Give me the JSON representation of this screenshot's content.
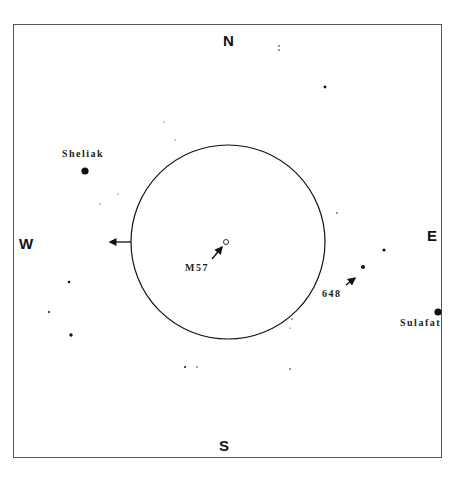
{
  "chart": {
    "title": "",
    "frame": {
      "x": 13,
      "y": 24,
      "w": 429,
      "h": 434
    },
    "directions": {
      "north": {
        "text": "N",
        "x": 223,
        "y": 33
      },
      "south": {
        "text": "S",
        "x": 219,
        "y": 438
      },
      "west": {
        "text": "W",
        "x": 19,
        "y": 236
      },
      "east": {
        "text": "E",
        "x": 427,
        "y": 228
      }
    },
    "field_circle": {
      "cx": 228,
      "cy": 242,
      "r": 97
    },
    "motion_arrow": {
      "x1": 131,
      "y1": 242,
      "x2": 110,
      "y2": 242,
      "direction": "west"
    },
    "labels": [
      {
        "id": "sheliak",
        "text": "Sheliak",
        "x": 62,
        "y": 149
      },
      {
        "id": "m57",
        "text": "M57",
        "x": 185,
        "y": 263
      },
      {
        "id": "sao-648",
        "text": "648",
        "x": 322,
        "y": 289
      },
      {
        "id": "sulafat",
        "text": "Sulafat",
        "x": 400,
        "y": 318
      }
    ],
    "targets": [
      {
        "id": "m57",
        "cx": 226,
        "cy": 242,
        "r": 2.5,
        "style": "ring"
      }
    ],
    "pointer_arrows": [
      {
        "id": "m57-pointer",
        "x1": 212,
        "y1": 259,
        "x2": 222,
        "y2": 247
      },
      {
        "id": "648-pointer",
        "x1": 346,
        "y1": 285,
        "x2": 355,
        "y2": 278
      }
    ],
    "stars": [
      {
        "name": "Sheliak",
        "cx": 85,
        "cy": 171,
        "r": 3.6
      },
      {
        "name": "Sulafat",
        "cx": 438,
        "cy": 312,
        "r": 3.6
      },
      {
        "name": "648",
        "cx": 363,
        "cy": 267,
        "r": 2
      },
      {
        "name": "",
        "cx": 384,
        "cy": 250,
        "r": 1.6
      },
      {
        "name": "",
        "cx": 325,
        "cy": 87,
        "r": 1.4
      },
      {
        "name": "",
        "cx": 279,
        "cy": 46,
        "r": 0.8
      },
      {
        "name": "",
        "cx": 279,
        "cy": 50,
        "r": 0.8
      },
      {
        "name": "",
        "cx": 69,
        "cy": 282,
        "r": 1.3
      },
      {
        "name": "",
        "cx": 49,
        "cy": 312,
        "r": 1
      },
      {
        "name": "",
        "cx": 71,
        "cy": 335,
        "r": 1.7
      },
      {
        "name": "",
        "cx": 185,
        "cy": 367,
        "r": 1
      },
      {
        "name": "",
        "cx": 197,
        "cy": 367,
        "r": 0.7
      },
      {
        "name": "",
        "cx": 290,
        "cy": 369,
        "r": 0.8
      },
      {
        "name": "",
        "cx": 337,
        "cy": 213,
        "r": 0.8
      },
      {
        "name": "",
        "cx": 164,
        "cy": 122,
        "r": 0.6
      },
      {
        "name": "",
        "cx": 175,
        "cy": 140,
        "r": 0.6
      },
      {
        "name": "",
        "cx": 100,
        "cy": 204,
        "r": 0.6
      },
      {
        "name": "",
        "cx": 118,
        "cy": 194,
        "r": 0.6
      },
      {
        "name": "",
        "cx": 292,
        "cy": 319,
        "r": 0.7
      },
      {
        "name": "",
        "cx": 290,
        "cy": 328,
        "r": 0.6
      }
    ],
    "colors": {
      "ink": "#111111",
      "frame": "#555555",
      "background": "#ffffff"
    }
  }
}
